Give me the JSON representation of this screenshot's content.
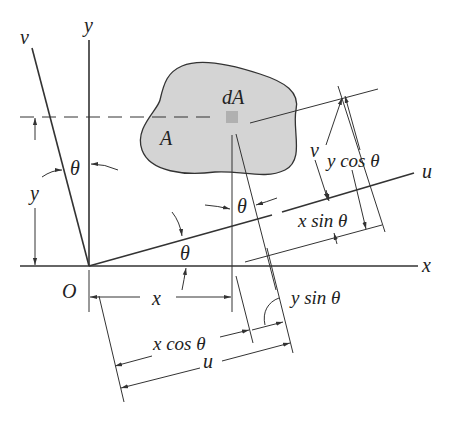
{
  "diagram": {
    "type": "coordinate-rotation",
    "colors": {
      "line": "#333333",
      "area_fill": "#d4d4d4",
      "element_fill": "#b0b0b0",
      "background": "#ffffff"
    },
    "labels": {
      "axis_x": "x",
      "axis_y": "y",
      "axis_u": "u",
      "axis_v": "v",
      "origin": "O",
      "area": "A",
      "element": "dA",
      "theta": "θ",
      "dim_x": "x",
      "dim_y": "y",
      "dim_u": "u",
      "dim_v": "v",
      "x_cos": "x cos θ",
      "y_sin": "y sin θ",
      "y_cos": "y cos θ",
      "x_sin": "x sin θ"
    }
  }
}
